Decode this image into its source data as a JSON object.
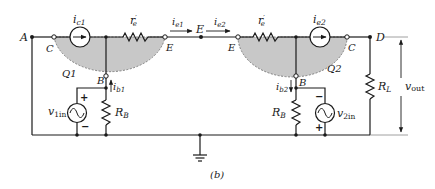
{
  "figure": {
    "caption": "(b)",
    "colors": {
      "wire": "#1a1a1a",
      "transistor_fill": "#c8c8c8",
      "transistor_edge": "#555555",
      "background": "#ffffff"
    }
  },
  "nodes": {
    "A": "A",
    "D": "D",
    "E_mid": "E"
  },
  "q1": {
    "name": "Q1",
    "collector": "C",
    "emitter": "E",
    "base": "B",
    "current_source": {
      "symbol": "i",
      "sub": "c1"
    },
    "emitter_resistor": {
      "symbol": "r",
      "sub": "e",
      "prime": "′"
    },
    "emitter_current": {
      "symbol": "i",
      "sub": "e1"
    },
    "base_current": {
      "symbol": "i",
      "sub": "b1"
    },
    "base_resistor": {
      "symbol": "R",
      "sub": "B"
    },
    "input_source": {
      "symbol": "v",
      "sub": "1in",
      "plus": "+",
      "minus": "−"
    }
  },
  "q2": {
    "name": "Q2",
    "collector": "C",
    "emitter": "E",
    "base": "B",
    "current_source": {
      "symbol": "i",
      "sub": "e2"
    },
    "emitter_resistor": {
      "symbol": "r",
      "sub": "e",
      "prime": "′"
    },
    "emitter_current": {
      "symbol": "i",
      "sub": "e2"
    },
    "base_current": {
      "symbol": "i",
      "sub": "b2"
    },
    "base_resistor": {
      "symbol": "R",
      "sub": "B"
    },
    "input_source": {
      "symbol": "v",
      "sub": "2in",
      "plus": "+",
      "minus": "−"
    }
  },
  "load": {
    "resistor": {
      "symbol": "R",
      "sub": "L"
    },
    "output_voltage": {
      "symbol": "v",
      "sub": "out"
    }
  }
}
